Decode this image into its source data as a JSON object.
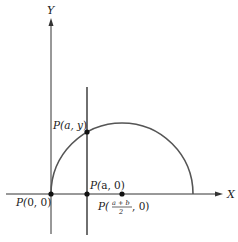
{
  "diagram": {
    "axes": {
      "x_label": "X",
      "y_label": "Y"
    },
    "points": {
      "origin": {
        "prefix": "P(",
        "args": "0, 0",
        "suffix": ")"
      },
      "on_curve": {
        "prefix": "P(",
        "args": "a, y",
        "suffix": ")"
      },
      "foot": {
        "prefix": "P(",
        "args": "a, 0",
        "suffix": ")"
      },
      "center": {
        "prefix": "P(",
        "frac_num": "a + b",
        "frac_den": "2",
        "rest": ", 0)"
      }
    },
    "colors": {
      "stroke": "#333333",
      "curve": "#555555",
      "background": "#ffffff"
    }
  }
}
